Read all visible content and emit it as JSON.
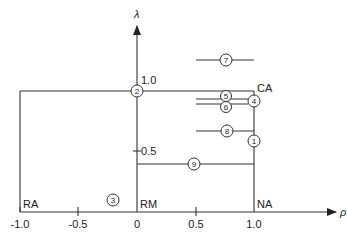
{
  "diagram": {
    "axes": {
      "x": {
        "label": "ρ",
        "ticks": [
          "-1.0",
          "-0.5",
          "0",
          "0.5",
          "1.0"
        ],
        "tick_values": [
          -1.0,
          -0.5,
          0,
          0.5,
          1.0
        ]
      },
      "y": {
        "label": "λ",
        "ticks": [
          "1.0",
          "0.5"
        ],
        "tick_values": [
          1.0,
          0.5
        ]
      }
    },
    "corner_labels": {
      "ra": "RA",
      "rm": "RM",
      "na": "NA",
      "ca": "CA"
    },
    "points": [
      {
        "id": "1",
        "label": "1"
      },
      {
        "id": "2",
        "label": "2"
      },
      {
        "id": "3",
        "label": "3"
      },
      {
        "id": "4",
        "label": "4"
      },
      {
        "id": "5",
        "label": "5"
      },
      {
        "id": "6",
        "label": "6"
      },
      {
        "id": "7",
        "label": "7"
      },
      {
        "id": "8",
        "label": "8"
      },
      {
        "id": "9",
        "label": "9"
      }
    ],
    "colors": {
      "line": "#333333",
      "background": "#ffffff"
    }
  }
}
